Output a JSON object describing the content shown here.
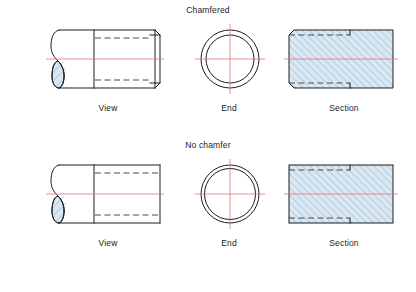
{
  "drawing": {
    "title_row_1": "Chamfered",
    "title_row_2": "No chamfer",
    "background_color": "#ffffff",
    "outline_color": "#1d1d1f",
    "hidden_line_color": "#4a4a4a",
    "center_line_color": "#e8707a",
    "section_fill_color": "#d9e8f2",
    "hatch_line_color": "#7fa8c4",
    "rows": [
      {
        "id": "chamfered",
        "label": "Chamfered",
        "chamfer": true,
        "figures": [
          {
            "id": "view",
            "caption": "View",
            "type": "partial-section-view",
            "features": [
              "broken-out-section",
              "hatched-break",
              "hidden-bore-lines",
              "chamfered-right-end",
              "horizontal-centerline"
            ]
          },
          {
            "id": "end",
            "caption": "End",
            "type": "end-view",
            "features": [
              "outer-circle",
              "inner-bore-circle",
              "vertical-centerline",
              "horizontal-centerline"
            ]
          },
          {
            "id": "section",
            "caption": "Section",
            "type": "full-section",
            "features": [
              "diagonal-hatch",
              "chamfer-corners",
              "hidden-bore-lines",
              "horizontal-centerline"
            ]
          }
        ]
      },
      {
        "id": "no-chamfer",
        "label": "No chamfer",
        "chamfer": false,
        "figures": [
          {
            "id": "view",
            "caption": "View",
            "type": "partial-section-view",
            "features": [
              "broken-out-section",
              "hatched-break",
              "hidden-bore-lines",
              "square-right-end",
              "horizontal-centerline"
            ]
          },
          {
            "id": "end",
            "caption": "End",
            "type": "end-view",
            "features": [
              "outer-circle",
              "inner-bore-circle",
              "vertical-centerline",
              "horizontal-centerline"
            ]
          },
          {
            "id": "section",
            "caption": "Section",
            "type": "full-section",
            "features": [
              "diagonal-hatch",
              "square-corners",
              "hidden-bore-lines",
              "horizontal-centerline"
            ]
          }
        ]
      }
    ],
    "captions": {
      "view": "View",
      "end": "End",
      "section": "Section"
    }
  }
}
